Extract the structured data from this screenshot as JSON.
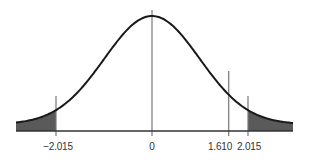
{
  "chart_data": {
    "type": "area",
    "title": "",
    "xlabel": "",
    "ylabel": "",
    "xlim": [
      -3.6,
      3.6
    ],
    "grid": false,
    "curve": "bell-shaped density centered at 0",
    "shaded_regions": [
      {
        "from": -3.6,
        "to": -2.015,
        "label": "left tail"
      },
      {
        "from": 2.015,
        "to": 3.6,
        "label": "right tail"
      }
    ],
    "vertical_lines": [
      -2.015,
      0,
      1.61,
      2.015
    ],
    "tick_labels": [
      "−2.015",
      "0",
      "1.610",
      "2.015"
    ],
    "colors": {
      "curve": "#1a1a1a",
      "shade": "#5a5a5a",
      "lines": "#777777",
      "axis": "#333333"
    }
  },
  "ticks": {
    "t1": "−2.015",
    "t2": "0",
    "t3": "1.610",
    "t4": "2.015"
  }
}
